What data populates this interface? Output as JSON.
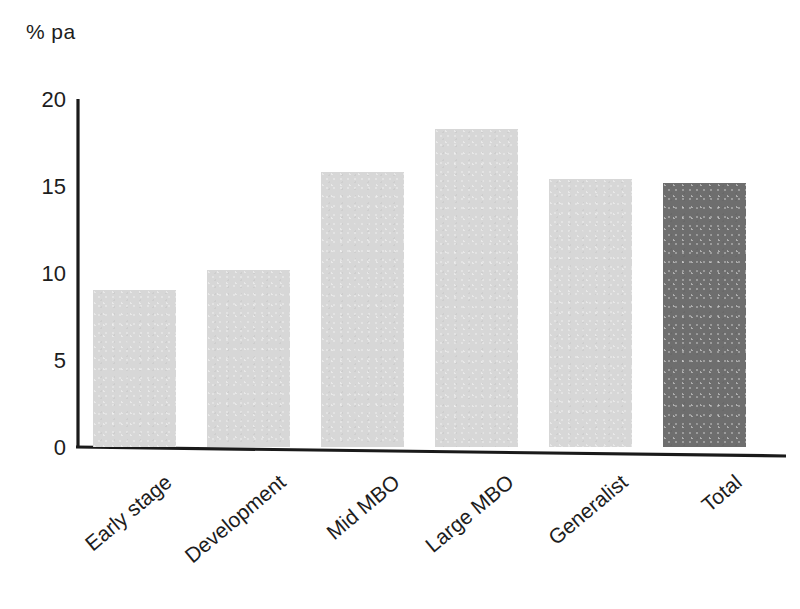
{
  "chart_data": {
    "type": "bar",
    "title": "",
    "subtitle": "",
    "xlabel": "",
    "ylabel": "% pa",
    "ylim": [
      0,
      20
    ],
    "yticks": [
      0,
      5,
      10,
      15,
      20
    ],
    "ytick_labels": [
      "0",
      "5",
      "10",
      "15",
      "20"
    ],
    "grid": false,
    "legend": null,
    "categories": [
      "Early stage",
      "Development",
      "Mid MBO",
      "Large MBO",
      "Generalist",
      "Total"
    ],
    "values": [
      9.0,
      10.2,
      15.8,
      18.3,
      15.4,
      15.2
    ],
    "bar_colors": [
      "#d7d7d7",
      "#d7d7d7",
      "#d7d7d7",
      "#d7d7d7",
      "#d7d7d7",
      "#6e6e6e"
    ],
    "annotations": []
  },
  "axis": {
    "unit_caption": "% pa",
    "line_color": "#1a1a1a"
  },
  "colors": {
    "background": "#ffffff",
    "bar_light": "#d7d7d7",
    "bar_dark": "#6e6e6e",
    "text": "#1d1d1d",
    "axis": "#1a1a1a"
  }
}
